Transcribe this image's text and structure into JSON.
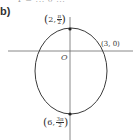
{
  "figure": {
    "part_label": "b)",
    "clipped_top_text": "r = ... θ ...",
    "curve": {
      "type": "ellipse",
      "center_px": [
        71,
        71
      ],
      "rx_px": 36,
      "ry_px": 43,
      "stroke_color": "#3a3a3a"
    },
    "axes": {
      "color": "#6a6a6a",
      "horizontal_y_px": 51,
      "vertical_x_px": 70
    },
    "origin_label": "O",
    "points": [
      {
        "id": "top",
        "coords_label_r": "2",
        "coords_label_theta_num": "π",
        "coords_label_theta_den": "2",
        "px": [
          70,
          29
        ]
      },
      {
        "id": "right",
        "coords_label": "(3, 0)",
        "px": [
          104,
          51
        ]
      },
      {
        "id": "bottom",
        "coords_label_r": "6",
        "coords_label_theta_num": "3π",
        "coords_label_theta_den": "2",
        "px": [
          70,
          114
        ]
      }
    ]
  }
}
